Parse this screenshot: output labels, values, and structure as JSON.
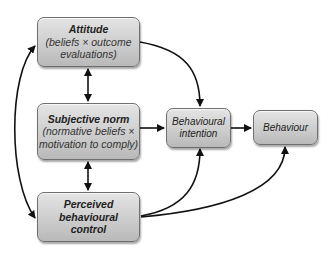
{
  "diagram": {
    "type": "flow",
    "nodes": [
      {
        "id": "attitude",
        "title": "Attitude",
        "subtitle_line1": "(beliefs × outcome",
        "subtitle_line2": "evaluations)"
      },
      {
        "id": "subjective_norm",
        "title": "Subjective norm",
        "subtitle_line1": "(normative beliefs ×",
        "subtitle_line2": "motivation to comply)"
      },
      {
        "id": "pbc",
        "title_line1": "Perceived",
        "title_line2": "behavioural",
        "title_line3": "control"
      },
      {
        "id": "intention",
        "line1": "Behavioural",
        "line2": "intention"
      },
      {
        "id": "behaviour",
        "label": "Behaviour"
      }
    ],
    "edges": [
      {
        "from": "attitude",
        "to": "intention",
        "style": "curved"
      },
      {
        "from": "subjective_norm",
        "to": "intention",
        "style": "straight"
      },
      {
        "from": "pbc",
        "to": "intention",
        "style": "curved"
      },
      {
        "from": "pbc",
        "to": "behaviour",
        "style": "curved"
      },
      {
        "from": "intention",
        "to": "behaviour",
        "style": "straight"
      },
      {
        "from": "attitude",
        "to": "subjective_norm",
        "style": "bidirectional"
      },
      {
        "from": "subjective_norm",
        "to": "pbc",
        "style": "bidirectional"
      },
      {
        "from": "attitude",
        "to": "pbc",
        "style": "bidirectional-curved"
      }
    ],
    "colors": {
      "box_border": "#6f6f6f",
      "box_fill_top": "#e4e4e4",
      "box_fill_bottom": "#b9b9b9",
      "arrow": "#111111"
    }
  }
}
